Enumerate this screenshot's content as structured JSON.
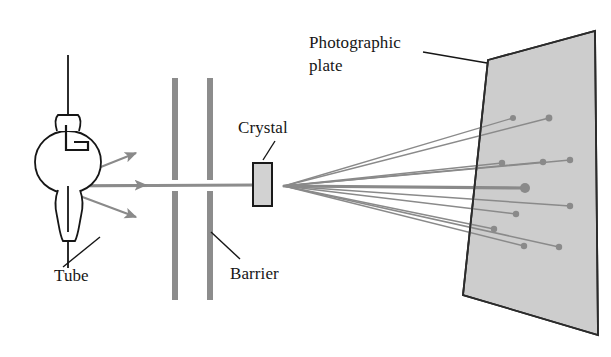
{
  "figure": {
    "background_color": "#ffffff",
    "ink_color": "#161616",
    "ray_color": "#8a8a8a",
    "beam_color": "#8d8d8d",
    "barrier_color": "#8c8c8c",
    "plate_fill": "#cdcdcd",
    "plate_stroke": "#2b2b2b",
    "crystal_fill": "#d2d2d2",
    "crystal_stroke": "#1a1a1a"
  },
  "labels": {
    "tube": "Tube",
    "barrier": "Barrier",
    "crystal": "Crystal",
    "photographic_plate_line1": "Photographic",
    "photographic_plate_line2": "plate"
  },
  "components": {
    "tube": {
      "name": "x-ray tube",
      "bulb_center_x": 68,
      "bulb_center_y": 162,
      "bulb_radius": 33,
      "stem_top_y": 55,
      "stem_bottom_y": 268,
      "source_x": 50,
      "source_y": 186
    },
    "barriers": [
      {
        "name": "barrier-left",
        "x": 172,
        "width": 6,
        "top": 78,
        "bottom": 300,
        "gap_top": 178,
        "gap_bottom": 190
      },
      {
        "name": "barrier-right",
        "x": 207,
        "width": 6,
        "top": 78,
        "bottom": 300,
        "gap_top": 178,
        "gap_bottom": 190
      }
    ],
    "crystal": {
      "name": "crystal",
      "x": 253,
      "y": 163,
      "width": 19,
      "height": 43
    },
    "photographic_plate": {
      "name": "photographic-plate",
      "corners": [
        [
          488,
          60
        ],
        [
          595,
          31
        ],
        [
          598,
          335
        ],
        [
          463,
          295
        ]
      ],
      "dashed_edge": [
        [
          488,
          60
        ],
        [
          463,
          295
        ]
      ]
    },
    "beam": {
      "name": "primary-beam",
      "from_x": 50,
      "from_y": 186,
      "to_x": 253,
      "to_y": 185
    },
    "scatter_origin": {
      "x": 284,
      "y": 186
    }
  },
  "chart_data": {
    "type": "scatter",
    "xlabel": "",
    "ylabel": "",
    "source_arrows": [
      {
        "name": "arrow-upper",
        "x1": 53,
        "y1": 186,
        "x2": 138,
        "y2": 152,
        "arrowhead": true
      },
      {
        "name": "arrow-middle",
        "x1": 53,
        "y1": 186,
        "x2": 148,
        "y2": 185,
        "arrowhead": true
      },
      {
        "name": "arrow-lower",
        "x1": 53,
        "y1": 186,
        "x2": 138,
        "y2": 218,
        "arrowhead": true
      }
    ],
    "diffracted_rays": [
      {
        "name": "ray-1",
        "x2": 513,
        "y2": 118,
        "width": 1.4,
        "dot": 3.0
      },
      {
        "name": "ray-2",
        "x2": 549,
        "y2": 118,
        "width": 1.4,
        "dot": 3.4
      },
      {
        "name": "ray-3",
        "x2": 502,
        "y2": 163,
        "width": 1.5,
        "dot": 3.2
      },
      {
        "name": "ray-4",
        "x2": 543,
        "y2": 162,
        "width": 1.5,
        "dot": 3.2
      },
      {
        "name": "ray-5",
        "x2": 570,
        "y2": 160,
        "width": 1.5,
        "dot": 3.2
      },
      {
        "name": "ray-6-central",
        "x2": 525,
        "y2": 188,
        "width": 3.2,
        "dot": 5.0
      },
      {
        "name": "ray-7",
        "x2": 570,
        "y2": 206,
        "width": 1.5,
        "dot": 3.2
      },
      {
        "name": "ray-8",
        "x2": 516,
        "y2": 214,
        "width": 1.5,
        "dot": 3.2
      },
      {
        "name": "ray-9",
        "x2": 494,
        "y2": 229,
        "width": 1.5,
        "dot": 3.2
      },
      {
        "name": "ray-10",
        "x2": 524,
        "y2": 246,
        "width": 1.5,
        "dot": 3.2
      },
      {
        "name": "ray-11",
        "x2": 559,
        "y2": 247,
        "width": 1.5,
        "dot": 3.2
      }
    ]
  },
  "leaders": {
    "tube": {
      "x1": 100,
      "y1": 237,
      "x2": 63,
      "y2": 267
    },
    "barrier": {
      "x1": 240,
      "y1": 259,
      "x2": 211,
      "y2": 232
    },
    "crystal": {
      "x1": 275,
      "y1": 141,
      "x2": 263,
      "y2": 160
    },
    "photographic_plate": {
      "x1": 423,
      "y1": 52,
      "x2": 487,
      "y2": 63
    }
  },
  "label_positions": {
    "tube": {
      "x": 54,
      "y": 281
    },
    "barrier": {
      "x": 230,
      "y": 279
    },
    "crystal": {
      "x": 238,
      "y": 133
    },
    "photographic_plate_line1": {
      "x": 309,
      "y": 48
    },
    "photographic_plate_line2": {
      "x": 309,
      "y": 71
    }
  }
}
